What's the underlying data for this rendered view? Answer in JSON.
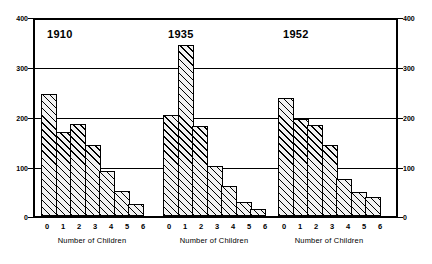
{
  "chart_data": {
    "type": "bar",
    "title": "",
    "subtitle": "",
    "xlabel": "Number of Children",
    "ylabel": "",
    "ylim": [
      0,
      400
    ],
    "yticks": [
      0,
      100,
      200,
      300,
      400
    ],
    "grid": true,
    "grid_values": [
      100,
      200,
      300
    ],
    "legend": "none",
    "dual_axis": true,
    "categories": [
      "0",
      "1",
      "2",
      "3",
      "4",
      "5",
      "6"
    ],
    "panels": [
      {
        "label": "1910",
        "xlabel": "Number of Children",
        "categories": [
          "0",
          "1",
          "2",
          "3",
          "4",
          "5",
          "6"
        ],
        "values": [
          248,
          172,
          187,
          145,
          92,
          52,
          25
        ]
      },
      {
        "label": "1935",
        "xlabel": "Number of Children",
        "categories": [
          "0",
          "1",
          "2",
          "3",
          "4",
          "5",
          "6"
        ],
        "values": [
          207,
          350,
          183,
          102,
          62,
          28,
          15
        ]
      },
      {
        "label": "1952",
        "xlabel": "Number of Children",
        "categories": [
          "0",
          "1",
          "2",
          "3",
          "4",
          "5",
          "6"
        ],
        "values": [
          240,
          198,
          185,
          145,
          75,
          50,
          38
        ]
      }
    ],
    "series": [
      {
        "name": "1910",
        "values": [
          248,
          172,
          187,
          145,
          92,
          52,
          25
        ]
      },
      {
        "name": "1935",
        "values": [
          207,
          350,
          183,
          102,
          62,
          28,
          15
        ]
      },
      {
        "name": "1952",
        "values": [
          240,
          198,
          185,
          145,
          75,
          50,
          38
        ]
      }
    ],
    "colors": {
      "axis": "#000000",
      "grid": "#000000",
      "bar_fill": "#f2f2f2",
      "bar_hatch": "#000000",
      "bar_edge": "#000000",
      "background": "#ffffff"
    }
  },
  "axis": {
    "left_ticks": [
      "400",
      "300",
      "200",
      "100",
      "0"
    ],
    "right_ticks": [
      "400",
      "300",
      "200",
      "100",
      "0"
    ]
  }
}
